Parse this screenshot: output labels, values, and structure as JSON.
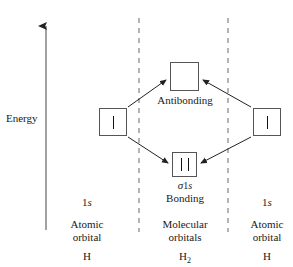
{
  "diagram": {
    "title_axis": "Energy",
    "axis": {
      "label": "Energy",
      "direction": "up",
      "arrow_name": "energy-axis-arrow"
    },
    "molecular": {
      "antibonding_label": "Antibonding",
      "bonding_label": "Bonding",
      "sigma_label_sigma": "σ",
      "sigma_label_n": "1",
      "sigma_label_s": "s",
      "antibonding_electrons": 0,
      "bonding_electrons": 2
    },
    "left_atom": {
      "orbital_label_n": "1",
      "orbital_label_s": "s",
      "type_line1": "Atomic",
      "type_line2": "orbital",
      "species": "H",
      "electrons": 1
    },
    "right_atom": {
      "orbital_label_n": "1",
      "orbital_label_s": "s",
      "type_line1": "Atomic",
      "type_line2": "orbital",
      "species": "H",
      "electrons": 1
    },
    "center_column": {
      "type_line1": "Molecular",
      "type_line2": "orbitals",
      "species_main": "H",
      "species_sub": "2"
    },
    "colors": {
      "stroke": "#555555",
      "text": "#1a1a1a",
      "dashed": "#777777",
      "arrow": "#222222",
      "background": "#ffffff"
    }
  }
}
